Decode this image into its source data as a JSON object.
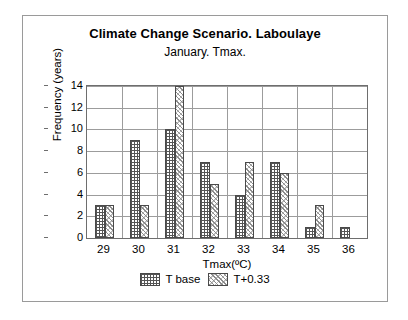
{
  "chart_data": {
    "type": "bar",
    "title": "Climate Change Scenario. Laboulaye",
    "subtitle": "January. Tmax.",
    "xlabel": "Tmax(ºC)",
    "ylabel": "Frequency (years)",
    "categories": [
      "29",
      "30",
      "31",
      "32",
      "33",
      "34",
      "35",
      "36"
    ],
    "series": [
      {
        "name": "T base",
        "values": [
          3,
          9,
          10,
          7,
          4,
          7,
          1,
          1
        ]
      },
      {
        "name": "T+0.33",
        "values": [
          3,
          3,
          14,
          5,
          7,
          6,
          3,
          0
        ]
      }
    ],
    "ylim": [
      0,
      14
    ],
    "ytick_labels": [
      "0",
      "2",
      "4",
      "6",
      "8",
      "10",
      "12",
      "14"
    ],
    "ytick_values": [
      0,
      2,
      4,
      6,
      8,
      10,
      12,
      14
    ],
    "grid": "horizontal-and-vertical",
    "legend_position": "bottom",
    "colors": {
      "bar_outline": "#4a4a4a",
      "gridline": "#9c9c9c",
      "axis": "#6e6e6e",
      "frame": "#9a9a9a",
      "text": "#000000",
      "background": "#ffffff"
    }
  },
  "legend": {
    "items": [
      {
        "label": "T base",
        "pattern": "grid-crosshatch"
      },
      {
        "label": "T+0.33",
        "pattern": "diagonal-hatch"
      }
    ]
  }
}
